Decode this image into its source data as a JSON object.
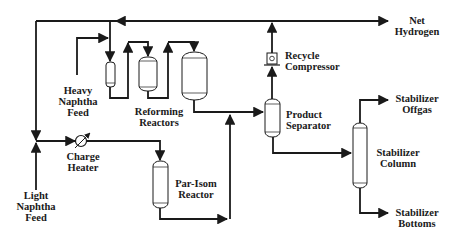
{
  "diagram": {
    "line_color": "#1a1a1a",
    "background": "#ffffff",
    "labels": {
      "net_hydrogen": [
        "Net",
        "Hydrogen"
      ],
      "recycle_compressor": [
        "Recycle",
        "Compressor"
      ],
      "heavy_naphtha_feed": [
        "Heavy",
        "Naphtha",
        "Feed"
      ],
      "reforming_reactors": [
        "Reforming",
        "Reactors"
      ],
      "product_separator": [
        "Product",
        "Separator"
      ],
      "stabilizer_offgas": [
        "Stabilizer",
        "Offgas"
      ],
      "stabilizer_column": [
        "Stabilizer",
        "Column"
      ],
      "charge_heater": [
        "Charge",
        "Heater"
      ],
      "par_isom_reactor": [
        "Par-Isom",
        "Reactor"
      ],
      "light_naphtha_feed": [
        "Light",
        "Naphtha",
        "Feed"
      ],
      "stabilizer_bottoms": [
        "Stabilizer",
        "Bottoms"
      ]
    },
    "equipment": [
      "Reforming Reactor 1",
      "Reforming Reactor 2",
      "Reforming Reactor 3",
      "Recycle Compressor",
      "Product Separator",
      "Stabilizer Column",
      "Charge Heater",
      "Par-Isom Reactor"
    ],
    "streams": [
      {
        "from": "Heavy Naphtha Feed",
        "to": "Reforming Reactors"
      },
      {
        "from": "Reforming Reactors",
        "to": "Product Separator"
      },
      {
        "from": "Product Separator",
        "to": "Recycle Compressor"
      },
      {
        "from": "Recycle Compressor",
        "to": "Net Hydrogen"
      },
      {
        "from": "Recycle Compressor",
        "to": "Reforming Reactors / Light Naphtha"
      },
      {
        "from": "Light Naphtha Feed",
        "to": "Charge Heater"
      },
      {
        "from": "Charge Heater",
        "to": "Par-Isom Reactor"
      },
      {
        "from": "Par-Isom Reactor",
        "to": "Product Separator"
      },
      {
        "from": "Product Separator",
        "to": "Stabilizer Column"
      },
      {
        "from": "Stabilizer Column",
        "to": "Stabilizer Offgas"
      },
      {
        "from": "Stabilizer Column",
        "to": "Stabilizer Bottoms"
      }
    ]
  }
}
